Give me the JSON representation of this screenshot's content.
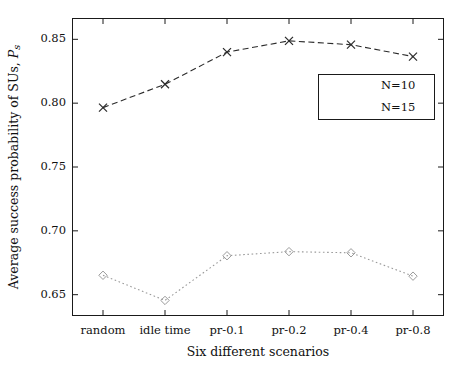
{
  "chart_data": {
    "type": "line",
    "title": "",
    "xlabel": "Six different scenarios",
    "ylabel_parts": {
      "main": "Average success probability of SUs, ",
      "symbol": "P",
      "subscript": "s"
    },
    "categories": [
      "random",
      "idle time",
      "pr-0.1",
      "pr-0.2",
      "pr-0.4",
      "pr-0.8"
    ],
    "yticks": [
      "0.65",
      "0.70",
      "0.75",
      "0.80",
      "0.85"
    ],
    "ylim": [
      0.6333,
      0.8667
    ],
    "grid": false,
    "legend_position": "upper right",
    "series": [
      {
        "name": "N=10",
        "marker": "diamond",
        "linestyle": "dotted",
        "color": "#9a9a9a",
        "values": [
          0.6652,
          0.6455,
          0.6805,
          0.6837,
          0.6828,
          0.6645
        ]
      },
      {
        "name": "N=15",
        "marker": "x",
        "linestyle": "dashed",
        "color": "#2b2b2b",
        "values": [
          0.7965,
          0.8148,
          0.84,
          0.8488,
          0.8458,
          0.8365
        ]
      }
    ]
  },
  "axis": {
    "frame_color": "#1a1a1a"
  }
}
